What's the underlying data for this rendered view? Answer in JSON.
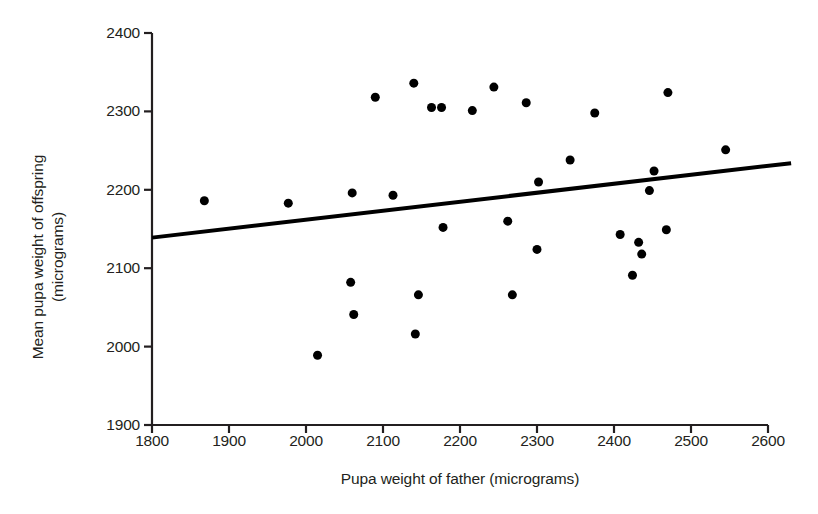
{
  "chart_data": {
    "type": "scatter",
    "title": "",
    "xlabel": "Pupa weight of father (micrograms)",
    "ylabel_line1": "Mean pupa weight of offspring",
    "ylabel_line2": "(micrograms)",
    "xlim": [
      1800,
      2600
    ],
    "ylim": [
      1900,
      2400
    ],
    "xticks": [
      1800,
      1900,
      2000,
      2100,
      2200,
      2300,
      2400,
      2500,
      2600
    ],
    "yticks": [
      1900,
      2000,
      2100,
      2200,
      2300,
      2400
    ],
    "grid": false,
    "legend": false,
    "marker": {
      "shape": "circle",
      "color": "#000000",
      "size_px": 9
    },
    "points": [
      {
        "x": 1868,
        "y": 2186
      },
      {
        "x": 1977,
        "y": 2183
      },
      {
        "x": 2015,
        "y": 1989
      },
      {
        "x": 2058,
        "y": 2082
      },
      {
        "x": 2060,
        "y": 2196
      },
      {
        "x": 2062,
        "y": 2041
      },
      {
        "x": 2090,
        "y": 2318
      },
      {
        "x": 2113,
        "y": 2193
      },
      {
        "x": 2140,
        "y": 2336
      },
      {
        "x": 2142,
        "y": 2016
      },
      {
        "x": 2146,
        "y": 2066
      },
      {
        "x": 2163,
        "y": 2305
      },
      {
        "x": 2176,
        "y": 2305
      },
      {
        "x": 2178,
        "y": 2152
      },
      {
        "x": 2216,
        "y": 2301
      },
      {
        "x": 2244,
        "y": 2331
      },
      {
        "x": 2262,
        "y": 2160
      },
      {
        "x": 2268,
        "y": 2066
      },
      {
        "x": 2286,
        "y": 2311
      },
      {
        "x": 2300,
        "y": 2124
      },
      {
        "x": 2302,
        "y": 2210
      },
      {
        "x": 2343,
        "y": 2238
      },
      {
        "x": 2375,
        "y": 2298
      },
      {
        "x": 2408,
        "y": 2143
      },
      {
        "x": 2424,
        "y": 2091
      },
      {
        "x": 2432,
        "y": 2133
      },
      {
        "x": 2436,
        "y": 2118
      },
      {
        "x": 2446,
        "y": 2199
      },
      {
        "x": 2452,
        "y": 2224
      },
      {
        "x": 2468,
        "y": 2149
      },
      {
        "x": 2470,
        "y": 2324
      },
      {
        "x": 2545,
        "y": 2251
      }
    ],
    "trend_line": {
      "type": "linear-fit",
      "x_start": 1800,
      "y_start": 2139,
      "x_end": 2630,
      "y_end": 2234,
      "color": "#000000",
      "width_px": 4
    },
    "axis": {
      "color": "#231f20",
      "width_px": 2.2,
      "plot_left_px": 152,
      "plot_right_px": 768,
      "plot_top_px": 33,
      "plot_bottom_px": 425
    }
  }
}
